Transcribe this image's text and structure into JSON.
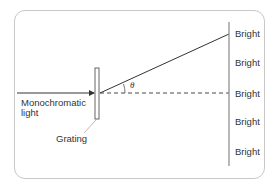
{
  "diagram": {
    "labels": {
      "source": "Monochromatic",
      "source_line2": "light",
      "grating": "Grating",
      "angle": "θ"
    },
    "screen_fringes": [
      "Bright",
      "Bright",
      "Bright",
      "Bright",
      "Bright"
    ],
    "colors": {
      "frame": "#c8c8c8",
      "lines": "#333333",
      "grating_leader": "#aaaaaa"
    }
  }
}
